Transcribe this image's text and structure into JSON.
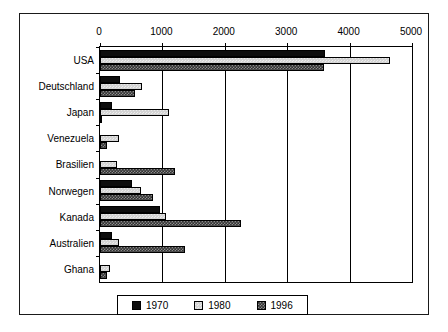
{
  "chart_data": {
    "type": "bar",
    "orientation": "horizontal",
    "title": "",
    "subtitle": "",
    "xlabel": "",
    "ylabel": "",
    "xlim": [
      0,
      5000
    ],
    "xticks": [
      0,
      1000,
      2000,
      3000,
      4000,
      5000
    ],
    "xtick_labels": [
      "0",
      "1000",
      "2000",
      "3000",
      "4000",
      "5000"
    ],
    "grid": true,
    "grid_axis": "x",
    "legend_position": "bottom",
    "categories": [
      "USA",
      "Deutschland",
      "Japan",
      "Venezuela",
      "Brasilien",
      "Norwegen",
      "Kanada",
      "Australien",
      "Ghana"
    ],
    "series": [
      {
        "name": "1970",
        "color": "#0d0d0d",
        "values": [
          3600,
          320,
          200,
          0,
          0,
          510,
          960,
          190,
          0
        ]
      },
      {
        "name": "1980",
        "color": "#d4d4d4",
        "values": [
          4650,
          670,
          1100,
          310,
          270,
          660,
          1060,
          300,
          160
        ]
      },
      {
        "name": "1996",
        "color": "#4d4d4d",
        "values": [
          3590,
          560,
          20,
          120,
          1200,
          850,
          2260,
          1360,
          110
        ]
      }
    ]
  },
  "legend": {
    "entries": [
      {
        "label": "1970",
        "swatch": "swatch-1970"
      },
      {
        "label": "1980",
        "swatch": "swatch-1980"
      },
      {
        "label": "1996",
        "swatch": "swatch-1996"
      }
    ]
  }
}
